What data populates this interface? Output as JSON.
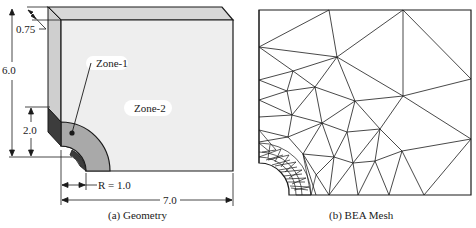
{
  "figure": {
    "panel_a": {
      "caption": "(a)  Geometry",
      "dimensions": {
        "thickness": "0.75",
        "height": "6.0",
        "zone1_height": "2.0",
        "radius": "R = 1.0",
        "width": "7.0"
      },
      "zones": {
        "zone1": "Zone-1",
        "zone2": "Zone-2"
      },
      "colors": {
        "front_face": "#eeeeee",
        "top_face": "#d8d8d8",
        "side_face": "#cfcfcf",
        "zone1_face": "#a9a9a9",
        "zone1_side": "#3c3c3c",
        "outline": "#1a1a1a"
      }
    },
    "panel_b": {
      "caption": "(b)  BEA Mesh",
      "mesh_color": "#1a1a1a"
    }
  }
}
